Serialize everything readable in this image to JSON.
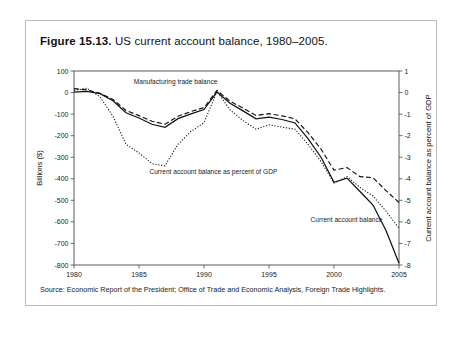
{
  "figure": {
    "number_label": "Figure 15.13.",
    "caption": "US current account balance, 1980–2005.",
    "source": "Source: Economic Report of the President; Office of Trade and Economic Analysis, Foreign Trade Highlights."
  },
  "chart_data": {
    "type": "line",
    "title": "US current account balance, 1980–2005",
    "xlabel": "",
    "ylabel": "Billions ($)",
    "y2label": "Current account balance as percent of GDP",
    "xlim": [
      1980,
      2005
    ],
    "ylim": [
      -800,
      100
    ],
    "y2lim": [
      -8,
      1
    ],
    "grid": false,
    "legend": "annotations-inline",
    "xticks": [
      1980,
      1985,
      1990,
      1995,
      2000,
      2005
    ],
    "yticks": [
      100,
      0,
      -100,
      -200,
      -300,
      -400,
      -500,
      -600,
      -700,
      -800
    ],
    "y2ticks": [
      1,
      0,
      -1,
      -2,
      -3,
      -4,
      -5,
      -6,
      -7,
      -8
    ],
    "x": [
      1980,
      1981,
      1982,
      1983,
      1984,
      1985,
      1986,
      1987,
      1988,
      1989,
      1990,
      1991,
      1992,
      1993,
      1994,
      1995,
      1996,
      1997,
      1998,
      1999,
      2000,
      2001,
      2002,
      2003,
      2004,
      2005
    ],
    "series": [
      {
        "name": "Current account balance",
        "style": "solid",
        "axis": "left",
        "units": "Billions ($)",
        "annotation": "Current account balance",
        "values": [
          2,
          5,
          -5,
          -38,
          -94,
          -118,
          -147,
          -161,
          -121,
          -99,
          -79,
          3,
          -50,
          -85,
          -122,
          -114,
          -125,
          -141,
          -214,
          -300,
          -416,
          -397,
          -459,
          -522,
          -640,
          -792
        ]
      },
      {
        "name": "Manufacturing trade balance",
        "style": "dashed",
        "axis": "left",
        "units": "Billions ($)",
        "annotation": "Manufacturing trade balance",
        "values": [
          18,
          12,
          -3,
          -32,
          -83,
          -107,
          -133,
          -147,
          -110,
          -88,
          -70,
          10,
          -40,
          -72,
          -106,
          -98,
          -108,
          -122,
          -186,
          -262,
          -360,
          -348,
          -390,
          -395,
          -455,
          -510
        ]
      },
      {
        "name": "Current account balance as percent of GDP",
        "style": "dotted",
        "axis": "right",
        "units": "percent of GDP",
        "annotation": "Current account balance  as percent of GDP",
        "values": [
          0.1,
          0.2,
          -0.2,
          -1.1,
          -2.4,
          -2.8,
          -3.3,
          -3.4,
          -2.4,
          -1.8,
          -1.4,
          0.05,
          -0.8,
          -1.3,
          -1.7,
          -1.5,
          -1.6,
          -1.7,
          -2.4,
          -3.2,
          -4.2,
          -3.9,
          -4.4,
          -4.8,
          -5.5,
          -6.3
        ]
      }
    ],
    "annotations": [
      {
        "text": "Manufacturing trade balance",
        "x": 1984.6,
        "y_px": 83
      },
      {
        "text": "Current account balance  as percent of GDP",
        "x": 1985.8,
        "y_px": 173
      },
      {
        "text": "Current account balance",
        "x": 1998.2,
        "y_px": 221
      }
    ]
  }
}
